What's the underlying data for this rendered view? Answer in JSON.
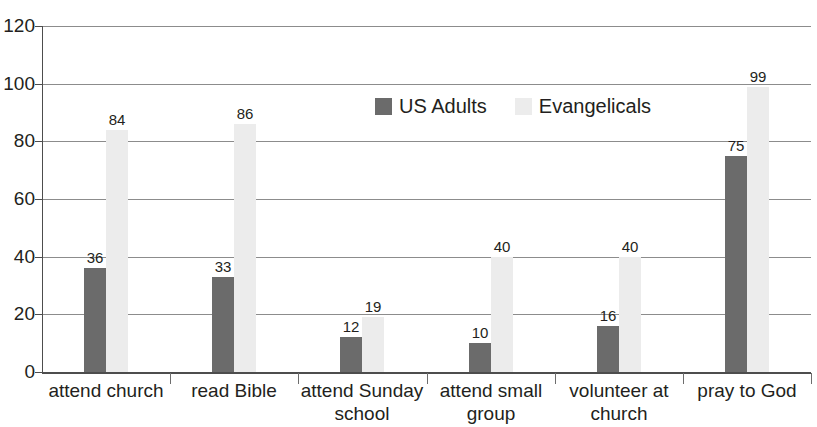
{
  "chart_data": {
    "type": "bar",
    "title": "",
    "xlabel": "",
    "ylabel": "",
    "ylim": [
      0,
      120
    ],
    "yticks": [
      0,
      20,
      40,
      60,
      80,
      100,
      120
    ],
    "grid": true,
    "legend_position": "top-center",
    "categories": [
      "attend church",
      "read Bible",
      "attend Sunday school",
      "attend small group",
      "volunteer at church",
      "pray to God"
    ],
    "category_lines": [
      [
        "attend church"
      ],
      [
        "read Bible"
      ],
      [
        "attend Sunday",
        "school"
      ],
      [
        "attend small",
        "group"
      ],
      [
        "volunteer at",
        "church"
      ],
      [
        "pray to God"
      ]
    ],
    "series": [
      {
        "name": "US Adults",
        "color": "#6b6b6b",
        "values": [
          36,
          33,
          12,
          10,
          16,
          75
        ]
      },
      {
        "name": "Evangelicals",
        "color": "#ececec",
        "values": [
          84,
          86,
          19,
          40,
          40,
          99
        ]
      }
    ]
  },
  "legend": {
    "items": [
      {
        "label": "US Adults",
        "swatch": "us"
      },
      {
        "label": "Evangelicals",
        "swatch": "ev"
      }
    ]
  },
  "axis": {
    "y_tick_labels": [
      "120",
      "100",
      "80",
      "60",
      "40",
      "20",
      "0"
    ]
  }
}
